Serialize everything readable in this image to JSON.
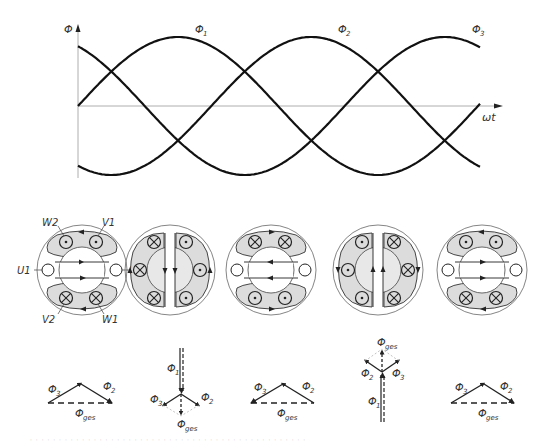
{
  "graph": {
    "y_axis_label": "Φ",
    "x_axis_label": "ωt",
    "curves": [
      {
        "name": "Φ1",
        "label": "Φ₁",
        "phase_deg": 0
      },
      {
        "name": "Φ2",
        "label": "Φ₂",
        "phase_deg": -120
      },
      {
        "name": "Φ3",
        "label": "Φ₃",
        "phase_deg": -240
      }
    ]
  },
  "stator": {
    "labels": {
      "W2": "W2",
      "V1": "V1",
      "U1": "U1",
      "U2": "U2",
      "V2": "V2",
      "W1": "W1"
    },
    "fill_color": "#d9d9d9",
    "stroke_color": "#333333"
  },
  "phasors": [
    {
      "labels": [
        "Φ3",
        "Φ2",
        "Φges"
      ]
    },
    {
      "labels": [
        "Φ1",
        "Φ3",
        "Φ2",
        "Φges"
      ]
    },
    {
      "labels": [
        "Φ3",
        "Φ2",
        "Φges"
      ]
    },
    {
      "labels": [
        "Φges",
        "Φ2",
        "Φ3",
        "Φ1"
      ]
    },
    {
      "labels": [
        "Φ3",
        "Φ2",
        "Φges"
      ]
    }
  ],
  "symbols": {
    "phi1": "Φ",
    "sub1": "1",
    "sub2": "2",
    "sub3": "3",
    "subges": "ges",
    "omega_t": "ωt"
  },
  "caption": "· · · · · · · · · · · · · · · · · · · · · · · · · · · · · · · · · · · · · · · · · · · · · · · ·"
}
